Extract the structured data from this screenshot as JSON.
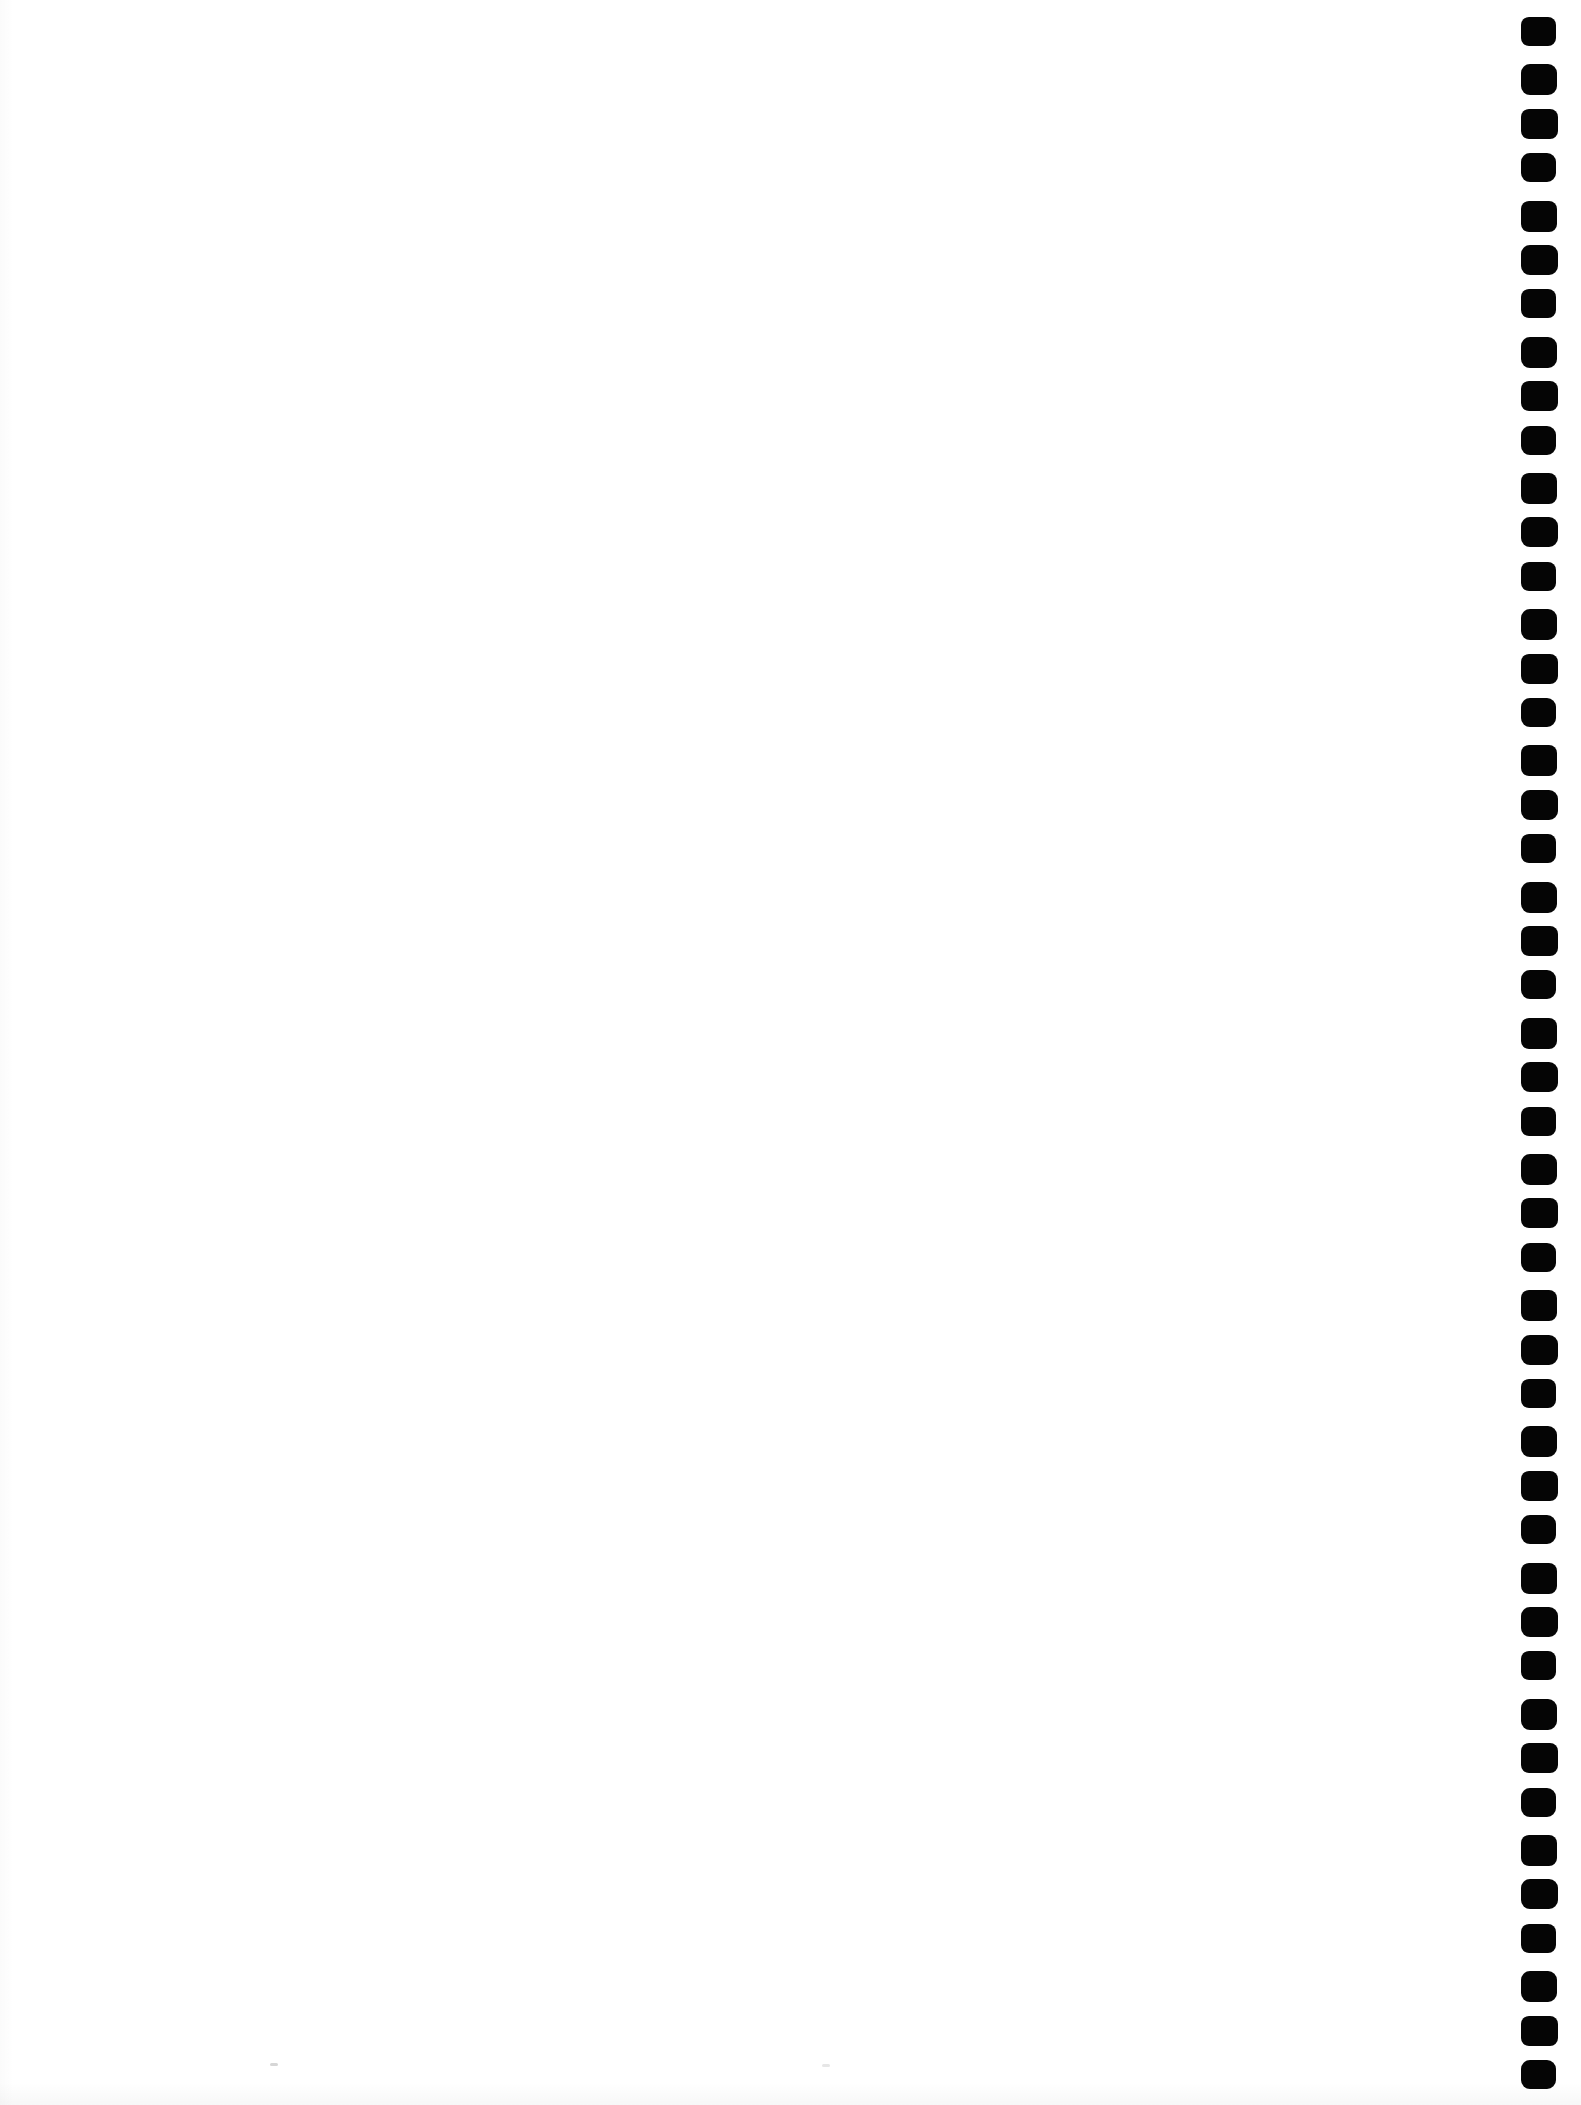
{
  "page": {
    "background_color": "#ffffff",
    "content": ""
  },
  "binding": {
    "side": "right",
    "hole_count": 46,
    "hole_color": "#050505"
  }
}
